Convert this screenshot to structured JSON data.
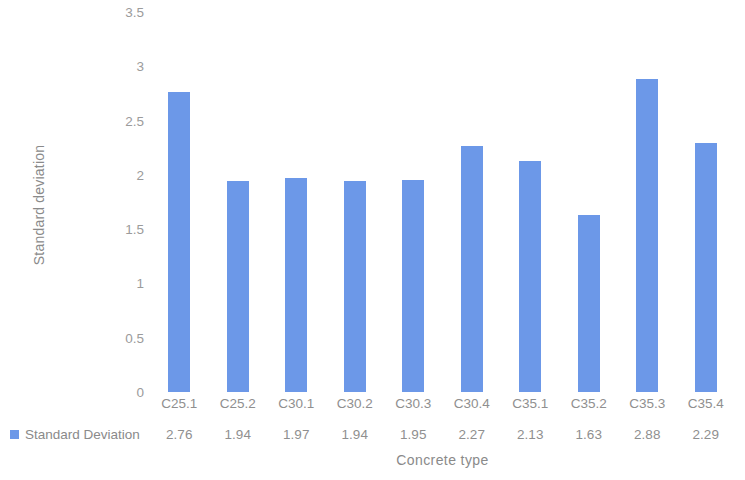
{
  "chart_data": {
    "type": "bar",
    "title": "",
    "xlabel": "Concrete type",
    "ylabel": "Standard deviation",
    "categories": [
      "C25.1",
      "C25.2",
      "C30.1",
      "C30.2",
      "C30.3",
      "C30.4",
      "C35.1",
      "C35.2",
      "C35.3",
      "C35.4"
    ],
    "series": [
      {
        "name": "Standard Deviation",
        "values": [
          2.76,
          1.94,
          1.97,
          1.94,
          1.95,
          2.27,
          2.13,
          1.63,
          2.88,
          2.29
        ],
        "color": "#6C98E8"
      }
    ],
    "value_labels": [
      "2.76",
      "1.94",
      "1.97",
      "1.94",
      "1.95",
      "2.27",
      "2.13",
      "1.63",
      "2.88",
      "2.29"
    ],
    "ylim": [
      0,
      3.5
    ],
    "ytick_values": [
      3.5,
      3,
      2.5,
      2,
      1.5,
      1,
      0.5,
      0
    ],
    "ytick_labels": [
      "3.5",
      "3",
      "2.5",
      "2",
      "1.5",
      "1",
      "0.5",
      "0"
    ],
    "grid": false,
    "legend": {
      "position": "bottom-left-table",
      "entries": [
        {
          "label": "Standard Deviation",
          "color": "#6C98E8"
        }
      ]
    },
    "data_table_visible": true,
    "background_color": "#ffffff",
    "text_color": "#8a8a8a"
  }
}
